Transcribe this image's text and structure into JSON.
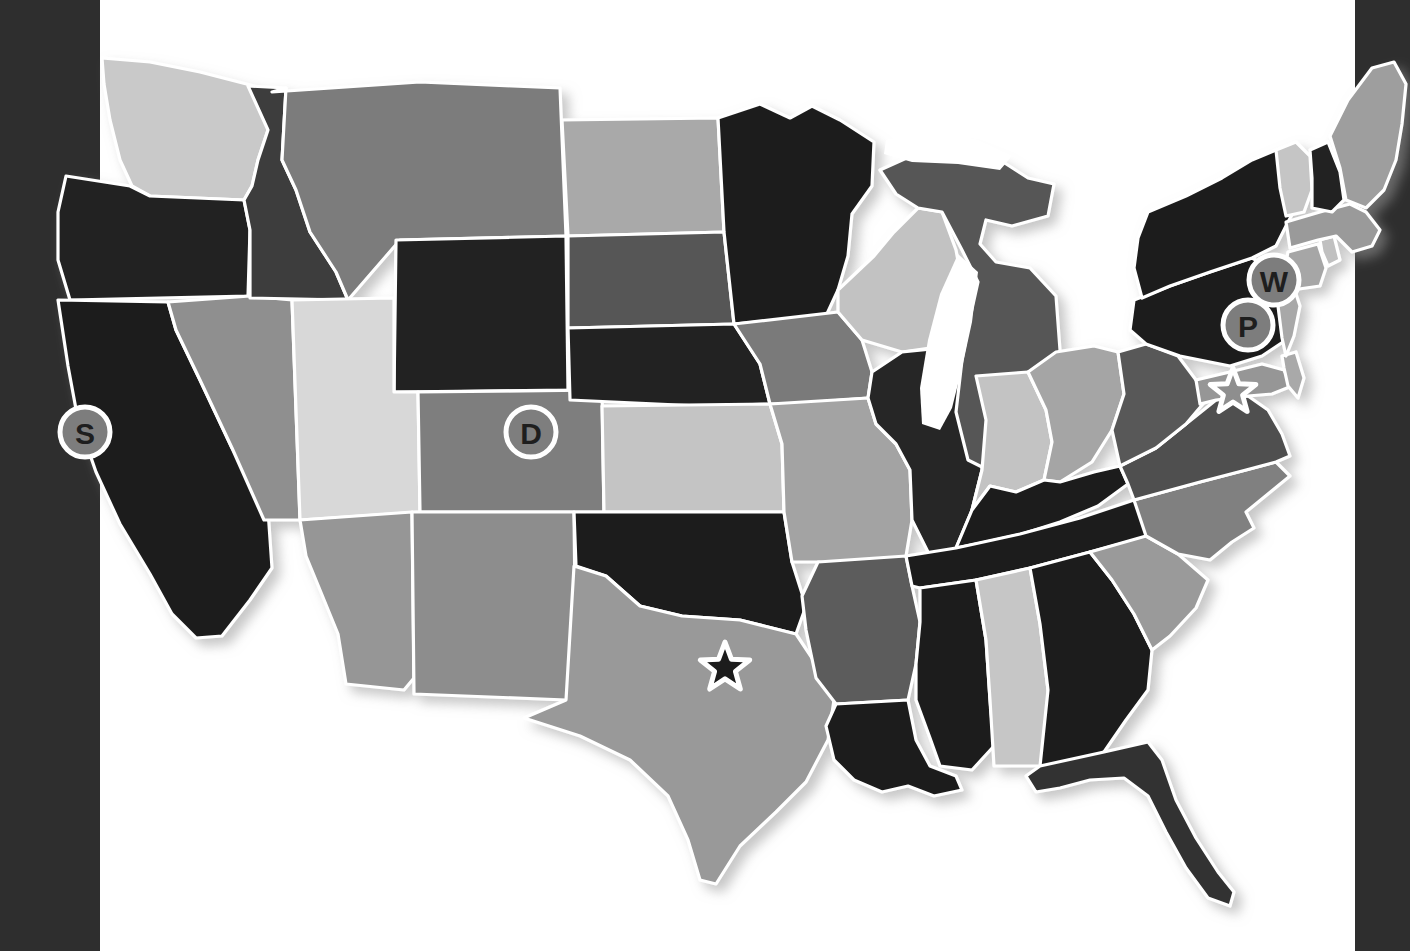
{
  "page": {
    "background_color": "#ffffff",
    "edge_band_color": "#2e2e2e",
    "border_color": "#ffffff"
  },
  "chart_data": {
    "type": "map",
    "subtitle": "",
    "projection": "albers-usa",
    "grid": false,
    "legend": "none",
    "value_scale": "grayscale",
    "shade_palette": {
      "very-light": "#d9d9d9",
      "light": "#c6c6c6",
      "mid-light": "#a8a8a8",
      "mid": "#949494",
      "mid-dark": "#777777",
      "dark": "#555555",
      "very-dark": "#3a3a3a",
      "near-black": "#1e1e1e"
    },
    "states": [
      {
        "code": "WA",
        "name": "Washington",
        "shade": "light",
        "color": "#c9c9c9"
      },
      {
        "code": "OR",
        "name": "Oregon",
        "shade": "near-black",
        "color": "#222222"
      },
      {
        "code": "CA",
        "name": "California",
        "shade": "near-black",
        "color": "#1f1f1f"
      },
      {
        "code": "NV",
        "name": "Nevada",
        "shade": "mid",
        "color": "#8f8f8f"
      },
      {
        "code": "ID",
        "name": "Idaho",
        "shade": "very-dark",
        "color": "#3c3c3c"
      },
      {
        "code": "MT",
        "name": "Montana",
        "shade": "mid-dark",
        "color": "#7b7b7b"
      },
      {
        "code": "WY",
        "name": "Wyoming",
        "shade": "near-black",
        "color": "#242424"
      },
      {
        "code": "UT",
        "name": "Utah",
        "shade": "very-light",
        "color": "#d8d8d8"
      },
      {
        "code": "CO",
        "name": "Colorado",
        "shade": "mid-dark",
        "color": "#7e7e7e"
      },
      {
        "code": "AZ",
        "name": "Arizona",
        "shade": "mid",
        "color": "#969696"
      },
      {
        "code": "NM",
        "name": "New Mexico",
        "shade": "mid",
        "color": "#8d8d8d"
      },
      {
        "code": "ND",
        "name": "North Dakota",
        "shade": "mid-light",
        "color": "#a9a9a9"
      },
      {
        "code": "SD",
        "name": "South Dakota",
        "shade": "dark",
        "color": "#565656"
      },
      {
        "code": "NE",
        "name": "Nebraska",
        "shade": "near-black",
        "color": "#232323"
      },
      {
        "code": "KS",
        "name": "Kansas",
        "shade": "light",
        "color": "#c4c4c4"
      },
      {
        "code": "OK",
        "name": "Oklahoma",
        "shade": "near-black",
        "color": "#1d1d1d"
      },
      {
        "code": "TX",
        "name": "Texas",
        "shade": "mid",
        "color": "#999999"
      },
      {
        "code": "MN",
        "name": "Minnesota",
        "shade": "near-black",
        "color": "#1f1f1f"
      },
      {
        "code": "IA",
        "name": "Iowa",
        "shade": "mid-dark",
        "color": "#7a7a7a"
      },
      {
        "code": "MO",
        "name": "Missouri",
        "shade": "mid-light",
        "color": "#a3a3a3"
      },
      {
        "code": "AR",
        "name": "Arkansas",
        "shade": "dark",
        "color": "#5b5b5b"
      },
      {
        "code": "LA",
        "name": "Louisiana",
        "shade": "near-black",
        "color": "#1d1d1d"
      },
      {
        "code": "WI",
        "name": "Wisconsin",
        "shade": "light",
        "color": "#c2c2c2"
      },
      {
        "code": "IL",
        "name": "Illinois",
        "shade": "near-black",
        "color": "#262626"
      },
      {
        "code": "MI",
        "name": "Michigan",
        "shade": "dark",
        "color": "#575757"
      },
      {
        "code": "IN",
        "name": "Indiana",
        "shade": "light",
        "color": "#c3c3c3"
      },
      {
        "code": "OH",
        "name": "Ohio",
        "shade": "mid-light",
        "color": "#a5a5a5"
      },
      {
        "code": "KY",
        "name": "Kentucky",
        "shade": "near-black",
        "color": "#1c1c1c"
      },
      {
        "code": "TN",
        "name": "Tennessee",
        "shade": "near-black",
        "color": "#1c1c1c"
      },
      {
        "code": "MS",
        "name": "Mississippi",
        "shade": "near-black",
        "color": "#1e1e1e"
      },
      {
        "code": "AL",
        "name": "Alabama",
        "shade": "light",
        "color": "#c6c6c6"
      },
      {
        "code": "GA",
        "name": "Georgia",
        "shade": "near-black",
        "color": "#1c1c1c"
      },
      {
        "code": "FL",
        "name": "Florida",
        "shade": "very-dark",
        "color": "#333333"
      },
      {
        "code": "SC",
        "name": "South Carolina",
        "shade": "mid",
        "color": "#9a9a9a"
      },
      {
        "code": "NC",
        "name": "North Carolina",
        "shade": "mid-dark",
        "color": "#808080"
      },
      {
        "code": "VA",
        "name": "Virginia",
        "shade": "dark",
        "color": "#4f4f4f"
      },
      {
        "code": "WV",
        "name": "West Virginia",
        "shade": "dark",
        "color": "#585858"
      },
      {
        "code": "MD",
        "name": "Maryland",
        "shade": "mid",
        "color": "#969696"
      },
      {
        "code": "DE",
        "name": "Delaware",
        "shade": "mid-light",
        "color": "#a9a9a9"
      },
      {
        "code": "PA",
        "name": "Pennsylvania",
        "shade": "near-black",
        "color": "#1d1d1d"
      },
      {
        "code": "NJ",
        "name": "New Jersey",
        "shade": "mid-light",
        "color": "#a8a8a8"
      },
      {
        "code": "NY",
        "name": "New York",
        "shade": "near-black",
        "color": "#1f1f1f"
      },
      {
        "code": "CT",
        "name": "Connecticut",
        "shade": "mid-light",
        "color": "#a6a6a6"
      },
      {
        "code": "RI",
        "name": "Rhode Island",
        "shade": "light",
        "color": "#c0c0c0"
      },
      {
        "code": "MA",
        "name": "Massachusetts",
        "shade": "mid",
        "color": "#9a9a9a"
      },
      {
        "code": "VT",
        "name": "Vermont",
        "shade": "light",
        "color": "#c5c5c5"
      },
      {
        "code": "NH",
        "name": "New Hampshire",
        "shade": "near-black",
        "color": "#222222"
      },
      {
        "code": "ME",
        "name": "Maine",
        "shade": "mid",
        "color": "#9e9e9e"
      }
    ],
    "lakes": [
      {
        "name": "Lake Michigan"
      },
      {
        "name": "Lake Superior"
      },
      {
        "name": "Lake Erie"
      }
    ],
    "markers": [
      {
        "id": "s-marker",
        "label": "S",
        "state": "CA",
        "style": "filled-circle",
        "x": 85,
        "y": 432,
        "radius": 25,
        "fill": "#7d7d7d",
        "text_color": "#1e1e1e"
      },
      {
        "id": "d-marker",
        "label": "D",
        "state": "CO",
        "style": "open-circle",
        "x": 531,
        "y": 432,
        "radius": 25,
        "fill": "none",
        "text_color": "#1e1e1e"
      },
      {
        "id": "w-marker",
        "label": "W",
        "state": "CT",
        "style": "filled-circle",
        "x": 1274,
        "y": 280,
        "radius": 25,
        "fill": "#7d7d7d",
        "text_color": "#1e1e1e"
      },
      {
        "id": "p-marker",
        "label": "P",
        "state": "PA",
        "style": "filled-circle",
        "x": 1248,
        "y": 325,
        "radius": 25,
        "fill": "#7d7d7d",
        "text_color": "#1e1e1e"
      }
    ],
    "stars": [
      {
        "id": "texas-star",
        "state": "TX",
        "x": 725,
        "y": 668,
        "radius": 26,
        "fill": "#1c1c1c",
        "outline": "#ffffff"
      },
      {
        "id": "capital-star",
        "state": "MD",
        "x": 1233,
        "y": 392,
        "radius": 24,
        "fill": "#8e8e8e",
        "outline": "#ffffff"
      }
    ]
  }
}
